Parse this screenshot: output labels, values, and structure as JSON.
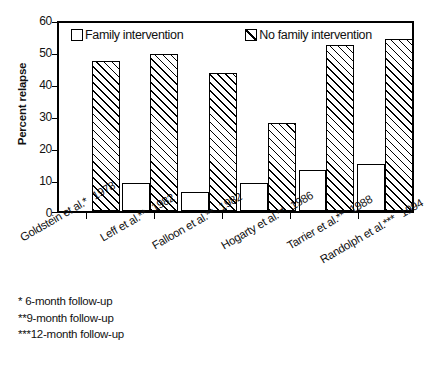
{
  "chart_data": {
    "type": "bar",
    "title": "",
    "xlabel": "",
    "ylabel": "Percent relapse",
    "ylim": [
      0,
      60
    ],
    "yticks": [
      0,
      10,
      20,
      30,
      40,
      50,
      60
    ],
    "grid": false,
    "legend_position": "top-inside",
    "categories": [
      "Goldstein et al.* 1978",
      "Leff et al.** 1982",
      "Falloon et al.** 1982",
      "Hogarty et al.** 1986",
      "Tarrier et al.** 1988",
      "Randolph et al.*** 1994"
    ],
    "category_parts": [
      {
        "study": "Goldstein et al.*",
        "year": "1978"
      },
      {
        "study": "Leff et al.**",
        "year": "1982"
      },
      {
        "study": "Falloon et al.**",
        "year": "1982"
      },
      {
        "study": "Hogarty et al.**",
        "year": "1986"
      },
      {
        "study": "Tarrier et al.**",
        "year": "1988"
      },
      {
        "study": "Randolph et al.***",
        "year": "1994"
      }
    ],
    "series": [
      {
        "name": "Family intervention",
        "style": "open",
        "values": [
          0,
          9,
          6,
          9,
          13,
          15
        ]
      },
      {
        "name": "No family intervention",
        "style": "hatched",
        "values": [
          48,
          50,
          44,
          28,
          53,
          55
        ]
      }
    ]
  },
  "legend": {
    "family_label": "Family intervention",
    "nofamily_label": "No family intervention"
  },
  "axis": {
    "ylabel": "Percent relapse",
    "ytick_0": "0",
    "ytick_10": "10",
    "ytick_20": "20",
    "ytick_30": "30",
    "ytick_40": "40",
    "ytick_50": "50",
    "ytick_60": "60"
  },
  "footnotes": [
    "*  6-month follow-up",
    "**9-month follow-up",
    "***12-month follow-up"
  ]
}
